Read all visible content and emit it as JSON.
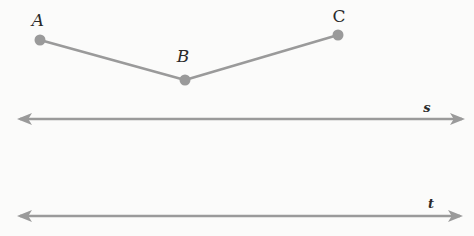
{
  "diagram": {
    "colors": {
      "line": "#9a9a9a",
      "point": "#9a9a9a",
      "background": "#fbfbfa"
    },
    "points": [
      {
        "name": "A",
        "x": 40,
        "y": 40,
        "label_x": 38,
        "label_y": 20
      },
      {
        "name": "B",
        "x": 185,
        "y": 80,
        "label_x": 183,
        "label_y": 56
      },
      {
        "name": "C",
        "x": 338,
        "y": 35,
        "label_x": 339,
        "label_y": 16
      }
    ],
    "segments": [
      [
        "A",
        "B"
      ],
      [
        "B",
        "C"
      ]
    ],
    "lines": [
      {
        "name": "s",
        "y": 119,
        "x1": 14,
        "x2": 468,
        "label_x": 427,
        "label_y": 107
      },
      {
        "name": "t",
        "y": 216,
        "x1": 14,
        "x2": 466,
        "label_x": 431,
        "label_y": 203
      }
    ]
  }
}
